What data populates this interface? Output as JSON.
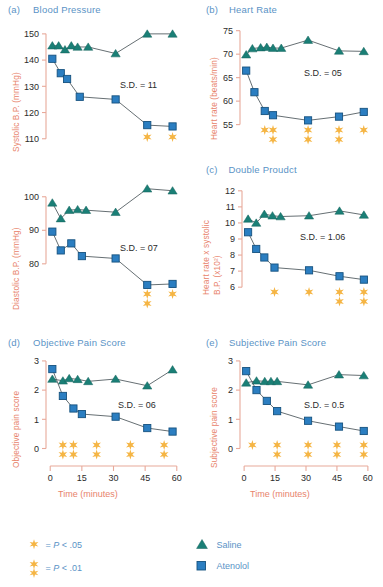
{
  "figure": {
    "width": 383,
    "height": 587,
    "colors": {
      "saline": "#1a7f76",
      "atenolol": "#2b7ec1",
      "star": "#f5b544",
      "axis": "#e8a99a",
      "axis_label": "#e8836b",
      "title": "#5a93c6",
      "line": "#555f63"
    }
  },
  "legend": {
    "significance": [
      {
        "symbol": "*",
        "text": "= P < .05",
        "p_label": "P",
        "op": "< .05",
        "level": "single"
      },
      {
        "symbol": "**",
        "text": "= P < .01",
        "p_label": "P",
        "op": "< .01",
        "level": "double"
      }
    ],
    "series": [
      {
        "marker": "triangle",
        "label": "Saline",
        "color": "#1a7f76"
      },
      {
        "marker": "square",
        "label": "Atenolol",
        "color": "#2b7ec1"
      }
    ]
  },
  "shared": {
    "xlabel": "Time (minutes)",
    "xticks": [
      0,
      15,
      30,
      45,
      60
    ],
    "xlim": [
      -2,
      62
    ]
  },
  "chart_data": [
    {
      "id": "a",
      "type": "line",
      "letter": "(a)",
      "title": "Blood Pressure",
      "ylabel": "Systolic B.P. (mmHg)",
      "xlabel": "",
      "ylim": [
        108,
        153
      ],
      "yticks": [
        110,
        120,
        130,
        140,
        150
      ],
      "xlim": [
        -2,
        62
      ],
      "xticks": [
        0,
        15,
        30,
        45,
        60
      ],
      "grid": false,
      "annotation": "S.D. = 11",
      "legend_position": "external-bottom",
      "series": [
        {
          "name": "Saline",
          "marker": "triangle",
          "color": "#1a7f76",
          "x": [
            1,
            4,
            7,
            10,
            13,
            18,
            31,
            46,
            58
          ],
          "values": [
            145.5,
            145.5,
            144,
            145.5,
            145,
            145,
            142.5,
            150,
            150
          ]
        },
        {
          "name": "Atenolol",
          "marker": "square",
          "color": "#2b7ec1",
          "x": [
            1,
            5,
            8,
            14,
            31,
            46,
            58
          ],
          "values": [
            140.5,
            135,
            132.8,
            126,
            125,
            115.2,
            114.7
          ]
        }
      ],
      "significance": [
        {
          "x": 46,
          "level": "single"
        },
        {
          "x": 58,
          "level": "single"
        }
      ]
    },
    {
      "id": "b",
      "type": "line",
      "letter": "(b)",
      "title": "Heart Rate",
      "ylabel": "Heart rate (beats/min)",
      "xlabel": "",
      "ylim": [
        53,
        76
      ],
      "yticks": [
        55,
        60,
        65,
        70,
        75
      ],
      "xlim": [
        -2,
        62
      ],
      "xticks": [
        0,
        15,
        30,
        45,
        60
      ],
      "grid": false,
      "annotation": "S.D. = 05",
      "legend_position": "external-bottom",
      "series": [
        {
          "name": "Saline",
          "marker": "triangle",
          "color": "#1a7f76",
          "x": [
            1,
            4,
            8,
            11,
            14,
            18,
            31,
            46,
            58
          ],
          "values": [
            69.9,
            71.2,
            71.4,
            71.5,
            71.3,
            71.3,
            73.0,
            70.7,
            70.6
          ]
        },
        {
          "name": "Atenolol",
          "marker": "square",
          "color": "#2b7ec1",
          "x": [
            1,
            5,
            10,
            14,
            31,
            46,
            58
          ],
          "values": [
            66.5,
            61.9,
            57.9,
            57.0,
            55.9,
            56.7,
            57.7
          ]
        }
      ],
      "significance": [
        {
          "x": 10,
          "level": "single"
        },
        {
          "x": 14,
          "level": "double"
        },
        {
          "x": 31,
          "level": "double"
        },
        {
          "x": 46,
          "level": "double"
        },
        {
          "x": 58,
          "level": "single"
        }
      ]
    },
    {
      "id": "a2",
      "type": "line",
      "letter": "",
      "title": "",
      "ylabel": "Diastolic B.P. (mmHg)",
      "xlabel": "",
      "ylim": [
        71,
        105
      ],
      "yticks": [
        80,
        90,
        100
      ],
      "xlim": [
        -2,
        62
      ],
      "xticks": [
        0,
        15,
        30,
        45,
        60
      ],
      "grid": false,
      "annotation": "S.D. = 07",
      "legend_position": "external-bottom",
      "series": [
        {
          "name": "Saline",
          "marker": "triangle",
          "color": "#1a7f76",
          "x": [
            1,
            5,
            9,
            13,
            17,
            31,
            46,
            58
          ],
          "values": [
            98.2,
            93.5,
            96.0,
            96.2,
            96.0,
            95.4,
            102.4,
            101.8
          ]
        },
        {
          "name": "Atenolol",
          "marker": "square",
          "color": "#2b7ec1",
          "x": [
            1,
            5,
            10,
            15,
            31,
            46,
            58
          ],
          "values": [
            89.6,
            84.0,
            86.1,
            82.3,
            81.6,
            73.7,
            74.0
          ]
        }
      ],
      "significance": [
        {
          "x": 46,
          "level": "double"
        },
        {
          "x": 58,
          "level": "single"
        }
      ]
    },
    {
      "id": "c",
      "type": "line",
      "letter": "(c)",
      "title": "Double Proudct",
      "ylabel": "Heart rate x systolic B.P. (x10²)",
      "ylabel_line1": "Heart rate x systolic",
      "ylabel_line2": "B.P. (x10²)",
      "xlabel": "",
      "ylim": [
        5.7,
        12.3
      ],
      "yticks": [
        6,
        7,
        8,
        9,
        10,
        11,
        12
      ],
      "xlim": [
        -2,
        62
      ],
      "xticks": [
        0,
        15,
        30,
        45,
        60
      ],
      "grid": false,
      "annotation": "S.D. = 1.06",
      "legend_position": "external-bottom",
      "series": [
        {
          "name": "Saline",
          "marker": "triangle",
          "color": "#1a7f76",
          "x": [
            1,
            5,
            9,
            13,
            17,
            31,
            46,
            58
          ],
          "values": [
            10.25,
            10.0,
            10.55,
            10.45,
            10.4,
            10.45,
            10.75,
            10.5
          ]
        },
        {
          "name": "Atenolol",
          "marker": "square",
          "color": "#2b7ec1",
          "x": [
            1,
            5,
            9,
            14,
            31,
            46,
            58
          ],
          "values": [
            9.42,
            8.38,
            7.85,
            7.22,
            7.05,
            6.68,
            6.47
          ]
        }
      ],
      "significance": [
        {
          "x": 14,
          "level": "single"
        },
        {
          "x": 31,
          "level": "single"
        },
        {
          "x": 46,
          "level": "double"
        },
        {
          "x": 58,
          "level": "double"
        }
      ]
    },
    {
      "id": "d",
      "type": "line",
      "letter": "(d)",
      "title": "Objective Pain Score",
      "ylabel": "Objective pain score",
      "xlabel": "Time (minutes)",
      "ylim": [
        -0.12,
        3.1
      ],
      "yticks": [
        0,
        1,
        2,
        3
      ],
      "xlim": [
        -2,
        62
      ],
      "xticks": [
        0,
        15,
        30,
        45,
        60
      ],
      "grid": false,
      "annotation": "S.D. = 06",
      "legend_position": "external-bottom",
      "series": [
        {
          "name": "Saline",
          "marker": "triangle",
          "color": "#1a7f76",
          "x": [
            1,
            6,
            9,
            13,
            18,
            31,
            46,
            58
          ],
          "values": [
            2.38,
            2.32,
            2.4,
            2.37,
            2.3,
            2.38,
            2.15,
            2.7
          ]
        },
        {
          "name": "Atenolol",
          "marker": "square",
          "color": "#2b7ec1",
          "x": [
            1,
            6,
            11,
            15,
            31,
            46,
            58
          ],
          "values": [
            2.72,
            1.8,
            1.37,
            1.18,
            1.09,
            0.7,
            0.58
          ]
        }
      ],
      "significance": [
        {
          "x": 6,
          "level": "double"
        },
        {
          "x": 11,
          "level": "double"
        },
        {
          "x": 22,
          "level": "double"
        },
        {
          "x": 38,
          "level": "double"
        },
        {
          "x": 54,
          "level": "double"
        }
      ]
    },
    {
      "id": "e",
      "type": "line",
      "letter": "(e)",
      "title": "Subjective Pain Score",
      "ylabel": "Subjective pain score",
      "xlabel": "Time (minutes)",
      "ylim": [
        -0.12,
        3.1
      ],
      "yticks": [
        0,
        1,
        2,
        3
      ],
      "xlim": [
        -2,
        62
      ],
      "xticks": [
        0,
        15,
        30,
        45,
        60
      ],
      "grid": false,
      "annotation": "S.D. = 0.5",
      "legend_position": "external-bottom",
      "series": [
        {
          "name": "Saline",
          "marker": "triangle",
          "color": "#1a7f76",
          "x": [
            1,
            6,
            10,
            13,
            16,
            31,
            46,
            58
          ],
          "values": [
            2.25,
            2.32,
            2.3,
            2.3,
            2.3,
            2.18,
            2.53,
            2.5
          ]
        },
        {
          "name": "Atenolol",
          "marker": "square",
          "color": "#2b7ec1",
          "x": [
            1,
            6,
            11,
            16,
            31,
            46,
            58
          ],
          "values": [
            2.65,
            2.0,
            1.63,
            1.28,
            0.95,
            0.75,
            0.6
          ]
        }
      ],
      "significance": [
        {
          "x": 4,
          "level": "single"
        },
        {
          "x": 16,
          "level": "double"
        },
        {
          "x": 31,
          "level": "double"
        },
        {
          "x": 45,
          "level": "double"
        },
        {
          "x": 58,
          "level": "double"
        }
      ]
    }
  ]
}
